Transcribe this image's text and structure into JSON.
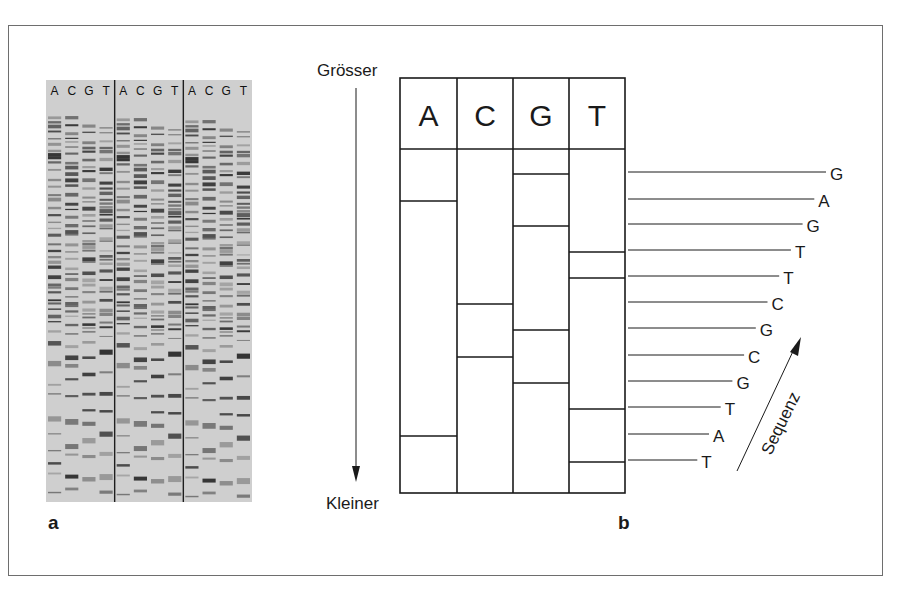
{
  "panel_a": {
    "label": "a",
    "lane_headers": [
      "A",
      "C",
      "G",
      "T",
      "A",
      "C",
      "G",
      "T",
      "A",
      "C",
      "G",
      "T"
    ],
    "groups": 3,
    "colors": {
      "background": "#cfcfcf",
      "band": "#2a2a2a",
      "divider": "#1e1e1e"
    }
  },
  "panel_b": {
    "label": "b",
    "axis_top": "Grösser",
    "axis_bottom": "Kleiner",
    "columns": [
      "A",
      "C",
      "G",
      "T"
    ],
    "sequence_arrow_label": "Sequenz",
    "bands_top_to_bottom": [
      "G",
      "A",
      "G",
      "T",
      "T",
      "C",
      "G",
      "C",
      "G",
      "T",
      "A",
      "T"
    ],
    "band_y": [
      174,
      201,
      226,
      252,
      278,
      304,
      330,
      357,
      383,
      409,
      436,
      462
    ]
  },
  "colors": {
    "line": "#1a1a1a",
    "frame": "#6e6e6e"
  }
}
